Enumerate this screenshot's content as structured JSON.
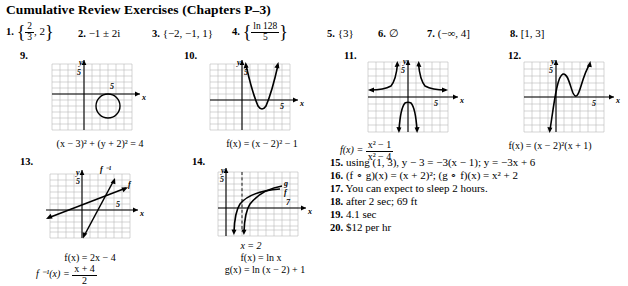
{
  "header": {
    "title": "Cumulative Review Exercises (Chapters P–3)"
  },
  "answers_row1": [
    {
      "num": "1.",
      "type": "set_frac",
      "frac_top": "2",
      "frac_bot": "3",
      "tail": ", 2"
    },
    {
      "num": "2.",
      "type": "plain",
      "text": "−1 ± 2i"
    },
    {
      "num": "3.",
      "type": "plain",
      "text": "{−2, −1, 1}"
    },
    {
      "num": "4.",
      "type": "set_frac2",
      "frac_top": "ln 128",
      "frac_bot": "5"
    },
    {
      "num": "5.",
      "type": "plain",
      "text": "{3}"
    },
    {
      "num": "6.",
      "type": "plain",
      "text": "∅"
    },
    {
      "num": "7.",
      "type": "plain",
      "text": "(−∞, 4]"
    },
    {
      "num": "8.",
      "type": "plain",
      "text": "[1, 3]"
    }
  ],
  "figures": [
    {
      "num": "9.",
      "caption": "(x − 3)² + (y + 2)² = 4",
      "axis_x_label": "x",
      "axis_y_label": "y",
      "tick_x": "5",
      "tick_y": "5"
    },
    {
      "num": "10.",
      "caption": "f(x) = (x − 2)² − 1",
      "axis_x_label": "x",
      "axis_y_label": "y",
      "tick_x": "5",
      "tick_y": "5"
    },
    {
      "num": "11.",
      "caption_lead": "f(x) = ",
      "caption_frac_top": "x² − 1",
      "caption_frac_bot": "x² − 4",
      "axis_x_label": "x",
      "axis_y_label": "y",
      "tick_x": "5",
      "tick_y": "5"
    },
    {
      "num": "12.",
      "caption": "f(x) = (x − 2)²(x + 1)",
      "axis_x_label": "x",
      "axis_y_label": "y",
      "tick_x": "5",
      "tick_y": "5"
    },
    {
      "num": "13.",
      "caption1": "f(x) = 2x − 4",
      "caption2_lead": "f ⁻¹(x) = ",
      "caption2_frac_top": "x + 4",
      "caption2_frac_bot": "2",
      "curve_label_f": "f",
      "curve_label_finv": "f ⁻¹",
      "axis_x_label": "x",
      "axis_y_label": "y",
      "tick_x": "5",
      "tick_y": "5"
    },
    {
      "num": "14.",
      "asymptote_label": "x = 2",
      "caption1": "f(x) = ln x",
      "caption2": "g(x) = ln (x − 2) + 1",
      "curve_label_f": "f",
      "curve_label_g": "g",
      "axis_x_label": "x",
      "axis_y_label": "y",
      "tick_x": "7",
      "tick_y": "5"
    }
  ],
  "answers_right": [
    {
      "num": "15.",
      "text": "using (1, 3), y − 3 = −3(x − 1); y = −3x + 6"
    },
    {
      "num": "16.",
      "text": "(f ∘ g)(x) = (x + 2)²; (g ∘ f)(x) = x² + 2"
    },
    {
      "num": "17.",
      "text": "You can expect to sleep 2 hours."
    },
    {
      "num": "18.",
      "text": "after 2 sec; 69 ft"
    },
    {
      "num": "19.",
      "text": "4.1 sec"
    },
    {
      "num": "20.",
      "text": "$12 per hr"
    }
  ]
}
